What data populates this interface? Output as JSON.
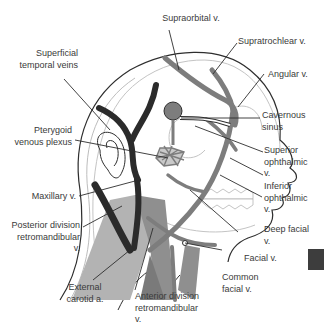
{
  "figure": {
    "colors": {
      "outline": "#2e2e2e",
      "faint_outline": "#bdbdbd",
      "vein_dark": "#2b2b2b",
      "vein_mid": "#7d7d7d",
      "muscle_gray": "#a8a8a8",
      "artery_gray": "#8f8f8f",
      "label_text": "#3a3a3a",
      "side_tab": "#3d3d3d"
    }
  },
  "labels": {
    "supraorbital": "Supraorbital v.",
    "supratrochlear": "Supratrochlear v.",
    "angular": "Angular v.",
    "cavernous_sinus": "Cavernous\nsinus",
    "superior_ophthalmic": "Superior\nophthalmic\nv.",
    "inferior_ophthalmic": "Inferior\nophthalmic\nv.",
    "deep_facial": "Deep facial\nv.",
    "facial": "Facial v.",
    "common_facial": "Common\nfacial v.",
    "anterior_division": "Anterior division\nretromandibular\nv.",
    "external_carotid": "External\ncarotid a.",
    "posterior_division": "Posterior division\nretromandibular\nv.",
    "maxillary": "Maxillary v.",
    "pterygoid": "Pterygoid\nvenous plexus",
    "superficial_temporal": "Superficial\ntemporal veins"
  }
}
